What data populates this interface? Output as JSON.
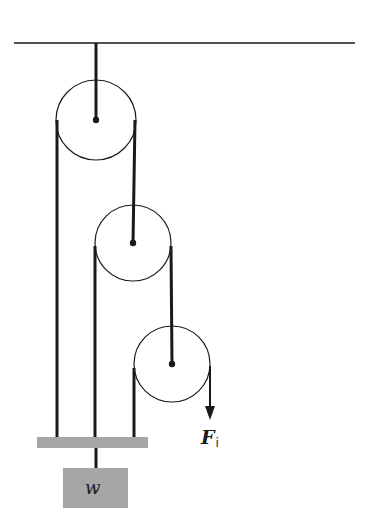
{
  "diagram": {
    "type": "pulley system",
    "pulley_count": 3,
    "labels": {
      "force_symbol": "F",
      "force_subscript": "i",
      "weight": "w"
    },
    "colors": {
      "line": "#1a1a1a",
      "bar": "#a6a6a6",
      "weight_box": "#a6a6a6",
      "background": "#ffffff"
    }
  }
}
